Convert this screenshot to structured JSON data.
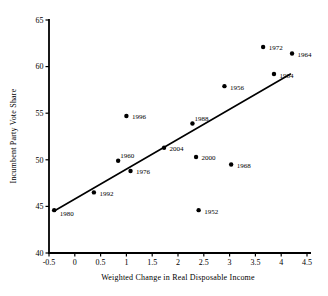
{
  "figure": {
    "background": "#ffffff",
    "ink_color": "#000000"
  },
  "chart_data": {
    "type": "scatter",
    "title": "",
    "xlabel": "Weighted Change in Real Disposable Income",
    "ylabel": "Incumbent Party Vote Share",
    "xlim": [
      -0.5,
      4.5
    ],
    "ylim": [
      40,
      65
    ],
    "x_ticks": [
      -0.5,
      0,
      0.5,
      1,
      1.5,
      2,
      2.5,
      3,
      3.5,
      4,
      4.5
    ],
    "x_tick_labels": [
      "-0.5",
      "0",
      "0.5",
      "1",
      "1.5",
      "2",
      "2.5",
      "3",
      "3.5",
      "4",
      "4.5"
    ],
    "y_ticks": [
      40,
      45,
      50,
      55,
      60,
      65
    ],
    "y_tick_labels": [
      "40",
      "45",
      "50",
      "55",
      "60",
      "65"
    ],
    "grid": false,
    "legend": "none",
    "marker": {
      "shape": "circle",
      "color": "#000000",
      "radius_px": 2.2
    },
    "points": [
      {
        "label": "1980",
        "x": -0.4,
        "y": 44.6,
        "label_pos": "below-right"
      },
      {
        "label": "1992",
        "x": 0.37,
        "y": 46.5,
        "label_pos": "right"
      },
      {
        "label": "1960",
        "x": 0.84,
        "y": 49.9,
        "label_pos": "above-right"
      },
      {
        "label": "1996",
        "x": 1.0,
        "y": 54.7,
        "label_pos": "right"
      },
      {
        "label": "1976",
        "x": 1.08,
        "y": 48.8,
        "label_pos": "right"
      },
      {
        "label": "2004",
        "x": 1.73,
        "y": 51.3,
        "label_pos": "right"
      },
      {
        "label": "1988",
        "x": 2.28,
        "y": 53.9,
        "label_pos": "above-right"
      },
      {
        "label": "2000",
        "x": 2.35,
        "y": 50.3,
        "label_pos": "right"
      },
      {
        "label": "1952",
        "x": 2.4,
        "y": 44.6,
        "label_pos": "right"
      },
      {
        "label": "1956",
        "x": 2.9,
        "y": 57.9,
        "label_pos": "right"
      },
      {
        "label": "1968",
        "x": 3.03,
        "y": 49.5,
        "label_pos": "right"
      },
      {
        "label": "1972",
        "x": 3.65,
        "y": 62.1,
        "label_pos": "right"
      },
      {
        "label": "1984",
        "x": 3.86,
        "y": 59.2,
        "label_pos": "right"
      },
      {
        "label": "1964",
        "x": 4.21,
        "y": 61.4,
        "label_pos": "right"
      }
    ],
    "trend_line": {
      "x1": -0.4,
      "y1": 44.5,
      "x2": 4.18,
      "y2": 59.2
    }
  }
}
